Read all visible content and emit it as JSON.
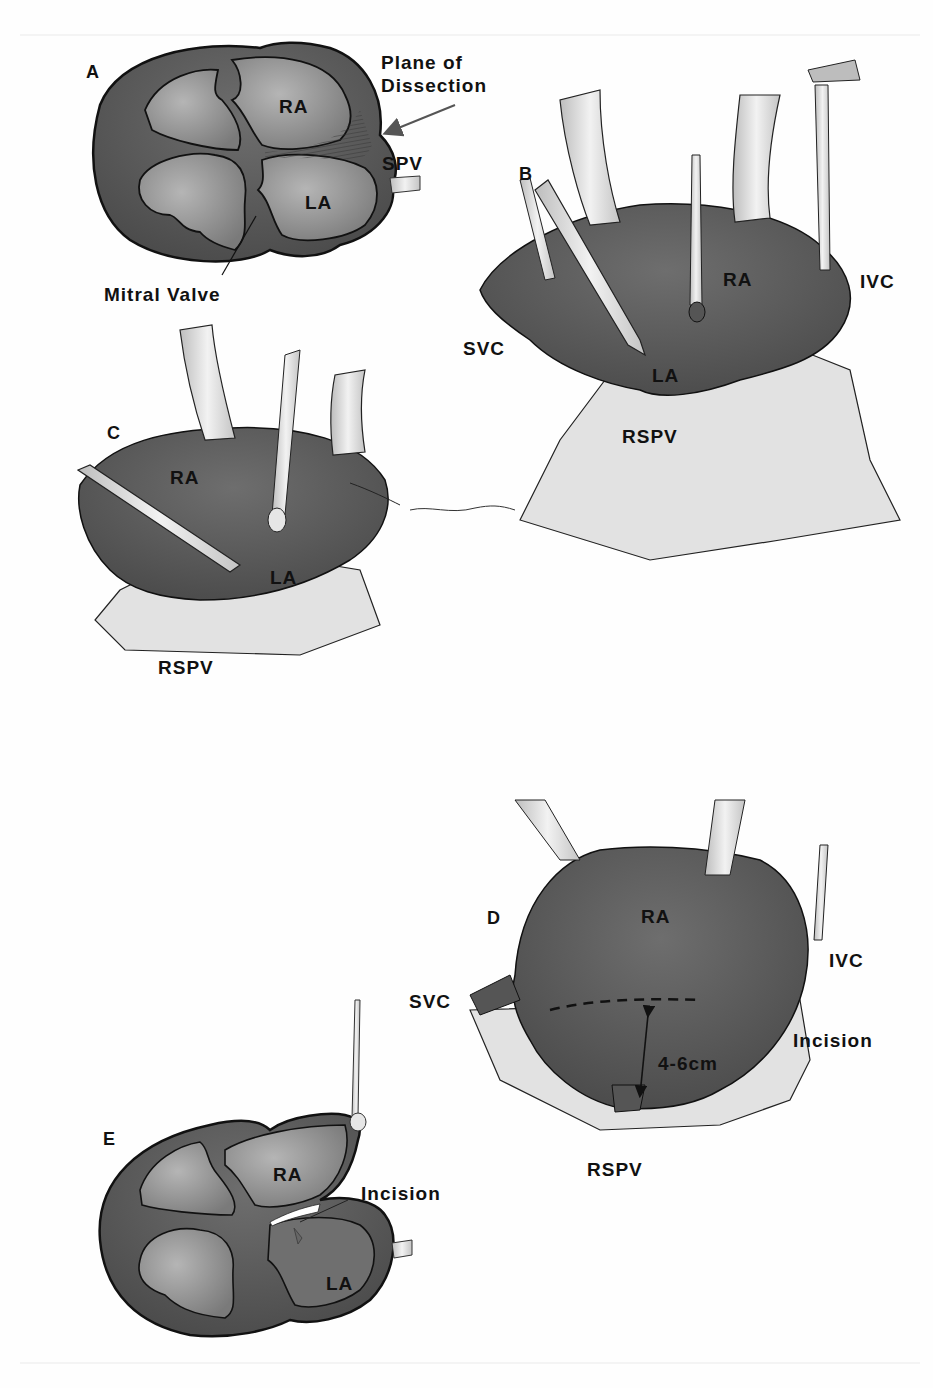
{
  "figure": {
    "panels": [
      {
        "id": "A",
        "labels": {
          "panel_letter": "A",
          "ra": "RA",
          "la": "LA",
          "spv": "SPV",
          "plane_of_dissection_line1": "Plane of",
          "plane_of_dissection_line2": "Dissection",
          "mitral_valve": "Mitral Valve"
        }
      },
      {
        "id": "B",
        "labels": {
          "panel_letter": "B",
          "ra": "RA",
          "la": "LA",
          "svc": "SVC",
          "ivc": "IVC",
          "rspv": "RSPV"
        }
      },
      {
        "id": "C",
        "labels": {
          "panel_letter": "C",
          "ra": "RA",
          "la": "LA",
          "rspv": "RSPV"
        }
      },
      {
        "id": "D",
        "labels": {
          "panel_letter": "D",
          "ra": "RA",
          "svc": "SVC",
          "ivc": "IVC",
          "incision": "Incision",
          "measurement": "4-6cm",
          "rspv": "RSPV"
        }
      },
      {
        "id": "E",
        "labels": {
          "panel_letter": "E",
          "ra": "RA",
          "la": "LA",
          "incision": "Incision"
        }
      }
    ],
    "colors": {
      "tissue_dark": "#545454",
      "tissue_mid": "#6a6a6a",
      "chamber_fill": "#8c8c8c",
      "cannula": "#d8d8d8",
      "drape": "#e4e4e4",
      "ink": "#111111",
      "arrow": "#555555"
    }
  }
}
